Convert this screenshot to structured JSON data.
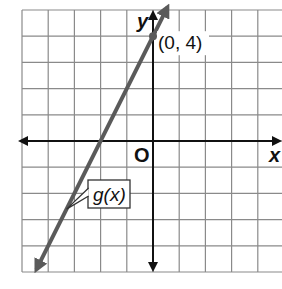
{
  "chart_data": {
    "type": "line",
    "title": "",
    "xlabel": "x",
    "ylabel": "y",
    "origin_label": "O",
    "xlim": [
      -5,
      5
    ],
    "ylim": [
      -5,
      5
    ],
    "grid": true,
    "tick_labels": false,
    "series": [
      {
        "name": "g(x)",
        "equation": "g(x) = 2x + 4",
        "slope": 2,
        "intercept": 4,
        "x": [
          -4.5,
          -2,
          0,
          0.5
        ],
        "y": [
          -5,
          0,
          4,
          5
        ],
        "color": "#5a5a5a",
        "arrows": "both"
      }
    ],
    "annotations": [
      {
        "text": "(0, 4)",
        "x": 0,
        "y": 4,
        "marker": "point"
      },
      {
        "text": "g(x)",
        "type": "callout",
        "points_to": {
          "x": -3.3,
          "y": -2.6
        }
      }
    ]
  }
}
